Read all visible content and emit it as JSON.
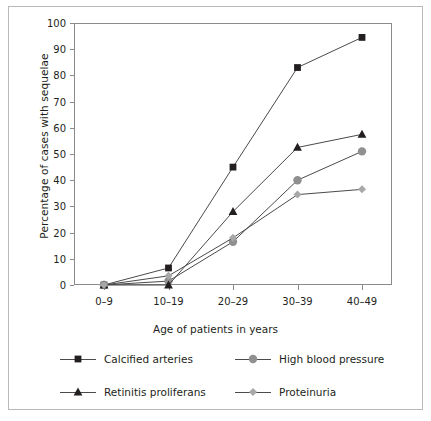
{
  "chart_data": {
    "type": "line",
    "title": "",
    "xlabel": "Age of patients in years",
    "ylabel": "Percentage of cases with sequelae",
    "categories": [
      "0–9",
      "10–19",
      "20–29",
      "30–39",
      "40–49"
    ],
    "ylim": [
      0,
      100
    ],
    "yticks": [
      0,
      10,
      20,
      30,
      40,
      50,
      60,
      70,
      80,
      90,
      100
    ],
    "ytick_labels": [
      "0",
      "10",
      "20",
      "30",
      "40",
      "50",
      "60",
      "70",
      "80",
      "90",
      "100"
    ],
    "grid": false,
    "legend_position": "bottom",
    "series": [
      {
        "name": "Calcified arteries",
        "marker": "square",
        "color": "#231f20",
        "line_color": "#4a4a4a",
        "values": [
          0,
          6.5,
          45,
          83,
          94.5
        ]
      },
      {
        "name": "High blood pressure",
        "marker": "circle",
        "color": "#909090",
        "line_color": "#4a4a4a",
        "values": [
          0,
          1.5,
          16.5,
          40,
          51
        ]
      },
      {
        "name": "Retinitis proliferans",
        "marker": "triangle",
        "color": "#231f20",
        "line_color": "#4a4a4a",
        "values": [
          0,
          0,
          28,
          52.5,
          57.5
        ]
      },
      {
        "name": "Proteinuria",
        "marker": "diamond",
        "color": "#a8a8a8",
        "line_color": "#4a4a4a",
        "values": [
          0,
          3.5,
          18,
          34.5,
          36.5
        ]
      }
    ],
    "legend_order": [
      "Calcified arteries",
      "High blood pressure",
      "Retinitis proliferans",
      "Proteinuria"
    ]
  }
}
